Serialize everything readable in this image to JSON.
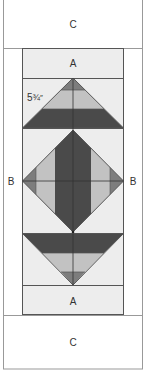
{
  "diagram": {
    "labels": {
      "top_c": "C",
      "top_a": "A",
      "left_b": "B",
      "right_b": "B",
      "bottom_a": "A",
      "bottom_c": "C"
    },
    "dimension": {
      "whole": "5",
      "fraction": "¾",
      "unit": "″"
    },
    "colors": {
      "background": "#ffffff",
      "background_strip": "#ededed",
      "dark": "#4a4a4a",
      "medium": "#7d7d7d",
      "light": "#c2c2c2",
      "line": "#555555",
      "frame_line": "#999999"
    }
  }
}
